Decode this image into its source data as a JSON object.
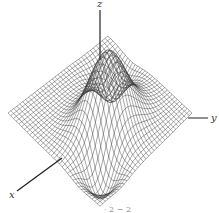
{
  "figure": {
    "axes": {
      "x_label": "x",
      "y_label": "y",
      "z_label": "z"
    },
    "caption_fragment": "· 2  − 2",
    "colors": {
      "background": "#ffffff",
      "mesh": "#3a3a3a",
      "axis": "#222222"
    },
    "surface": {
      "function": "z = peak ridge with two valleys",
      "grid_lines": 34,
      "domain": [
        -2,
        2
      ]
    }
  }
}
